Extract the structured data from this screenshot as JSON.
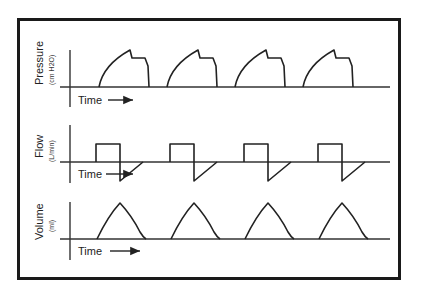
{
  "diagram": {
    "panels": [
      {
        "id": "pressure",
        "title": "Pressure",
        "unit": "(cm H2O)",
        "time_label": "Time",
        "waveform": "pressure-control"
      },
      {
        "id": "flow",
        "title": "Flow",
        "unit": "(L/min)",
        "time_label": "Time",
        "waveform": "square-wave"
      },
      {
        "id": "volume",
        "title": "Volume",
        "unit": "(ml)",
        "time_label": "Time",
        "waveform": "triangular"
      }
    ],
    "cycles": 4
  }
}
